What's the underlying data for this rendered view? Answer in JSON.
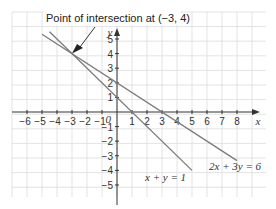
{
  "chart_data": {
    "type": "line",
    "title": "Point of intersection at (−3, 4)",
    "xlabel": "x",
    "ylabel": "y",
    "origin_label": "0",
    "xlim": [
      -7,
      9
    ],
    "ylim": [
      -6,
      6
    ],
    "x_ticks": [
      "−6",
      "−5",
      "−4",
      "−3",
      "−2",
      "−1",
      "1",
      "2",
      "3",
      "4",
      "5",
      "6",
      "7",
      "8"
    ],
    "x_tick_values": [
      -6,
      -5,
      -4,
      -3,
      -2,
      -1,
      1,
      2,
      3,
      4,
      5,
      6,
      7,
      8
    ],
    "y_ticks": [
      "5",
      "4",
      "3",
      "2",
      "1",
      "−1",
      "−2",
      "−3",
      "−4",
      "−5"
    ],
    "y_tick_values": [
      5,
      4,
      3,
      2,
      1,
      -1,
      -2,
      -3,
      -4,
      -5
    ],
    "grid": true,
    "series": [
      {
        "name": "x + y = 1",
        "points": [
          [
            -4.5,
            5.5
          ],
          [
            5,
            -4
          ]
        ]
      },
      {
        "name": "2x + 3y = 6",
        "points": [
          [
            -5,
            5.33
          ],
          [
            8,
            -3.33
          ]
        ]
      }
    ],
    "annotations": [
      {
        "text": "Point of intersection at (−3, 4)",
        "point": [
          -3,
          4
        ]
      }
    ]
  },
  "labels": {
    "title": "Point of intersection at (−3, 4)",
    "line1": "x + y = 1",
    "line2": "2x + 3y = 6",
    "x_axis": "x",
    "y_axis": "y",
    "origin": "0"
  },
  "colors": {
    "grid": "#dcdcdc",
    "axis": "#333333",
    "line": "#7a7a7a"
  }
}
